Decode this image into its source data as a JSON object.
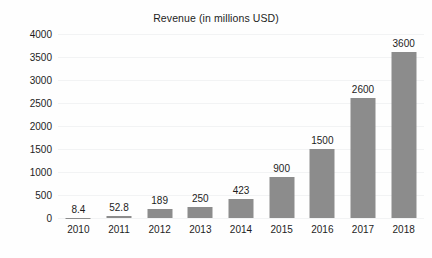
{
  "chart_data": {
    "type": "bar",
    "title": "Revenue (in millions USD)",
    "xlabel": "",
    "ylabel": "",
    "categories": [
      "2010",
      "2011",
      "2012",
      "2013",
      "2014",
      "2015",
      "2016",
      "2017",
      "2018"
    ],
    "values": [
      8.4,
      52.8,
      189,
      250,
      423,
      900,
      1500,
      2600,
      3600
    ],
    "value_labels": [
      "8.4",
      "52.8",
      "189",
      "250",
      "423",
      "900",
      "1500",
      "2600",
      "3600"
    ],
    "series": [
      {
        "name": "Revenue",
        "values": [
          8.4,
          52.8,
          189,
          250,
          423,
          900,
          1500,
          2600,
          3600
        ]
      }
    ],
    "ylim": [
      0,
      4000
    ],
    "ytick_labels": [
      "0",
      "500",
      "1000",
      "1500",
      "2000",
      "2500",
      "3000",
      "3500",
      "4000"
    ],
    "ytick_values": [
      0,
      500,
      1000,
      1500,
      2000,
      2500,
      3000,
      3500,
      4000
    ],
    "grid": true,
    "legend": false,
    "legend_position": "none",
    "bar_color": "#8c8c8c",
    "background_color": "#fefefe",
    "gridline_color": "#f2f3f4",
    "text_color": "#1d1d1d"
  }
}
